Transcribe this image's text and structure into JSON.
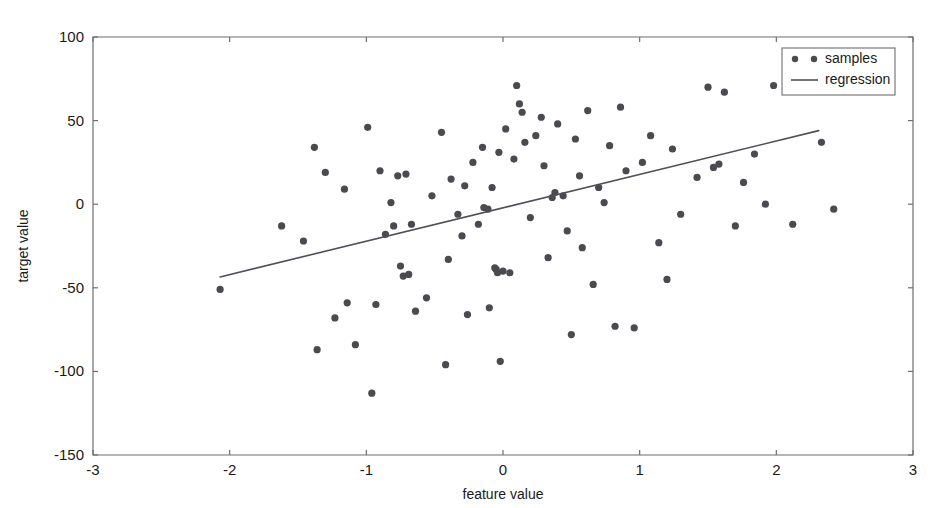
{
  "chart_data": {
    "type": "scatter",
    "title": "",
    "xlabel": "feature value",
    "ylabel": "target value",
    "xlim": [
      -3,
      3
    ],
    "ylim": [
      -150,
      100
    ],
    "xticks": [
      -3,
      -2,
      -1,
      0,
      1,
      2,
      3
    ],
    "xtick_labels": [
      "-3",
      "-2",
      "-1",
      "0",
      "1",
      "2",
      "3"
    ],
    "yticks": [
      -150,
      -100,
      -50,
      0,
      50,
      100
    ],
    "ytick_labels": [
      "-150",
      "-100",
      "-50",
      "0",
      "50",
      "100"
    ],
    "grid": false,
    "legend_position": "upper right",
    "series": [
      {
        "name": "samples",
        "type": "scatter",
        "marker": "circle",
        "color": "#4a4a50",
        "points": [
          [
            -2.07,
            -51
          ],
          [
            -1.62,
            -13
          ],
          [
            -1.46,
            -22
          ],
          [
            -1.38,
            34
          ],
          [
            -1.36,
            -87
          ],
          [
            -1.3,
            19
          ],
          [
            -1.23,
            -68
          ],
          [
            -1.16,
            9
          ],
          [
            -1.14,
            -59
          ],
          [
            -1.08,
            -84
          ],
          [
            -0.99,
            46
          ],
          [
            -0.96,
            -113
          ],
          [
            -0.93,
            -60
          ],
          [
            -0.9,
            20
          ],
          [
            -0.86,
            -18
          ],
          [
            -0.82,
            1
          ],
          [
            -0.8,
            -13
          ],
          [
            -0.77,
            17
          ],
          [
            -0.75,
            -37
          ],
          [
            -0.73,
            -43
          ],
          [
            -0.71,
            18
          ],
          [
            -0.69,
            -42
          ],
          [
            -0.67,
            -12
          ],
          [
            -0.64,
            -64
          ],
          [
            -0.56,
            -56
          ],
          [
            -0.52,
            5
          ],
          [
            -0.45,
            43
          ],
          [
            -0.42,
            -96
          ],
          [
            -0.4,
            -33
          ],
          [
            -0.38,
            15
          ],
          [
            -0.33,
            -6
          ],
          [
            -0.3,
            -19
          ],
          [
            -0.28,
            11
          ],
          [
            -0.26,
            -66
          ],
          [
            -0.22,
            25
          ],
          [
            -0.18,
            -12
          ],
          [
            -0.15,
            34
          ],
          [
            -0.14,
            -2
          ],
          [
            -0.11,
            -3
          ],
          [
            -0.1,
            -62
          ],
          [
            -0.08,
            10
          ],
          [
            -0.06,
            -38
          ],
          [
            -0.05,
            -39
          ],
          [
            -0.04,
            -41
          ],
          [
            -0.03,
            31
          ],
          [
            -0.02,
            -94
          ],
          [
            0.0,
            -40
          ],
          [
            0.02,
            45
          ],
          [
            0.05,
            -41
          ],
          [
            0.08,
            27
          ],
          [
            0.1,
            71
          ],
          [
            0.12,
            60
          ],
          [
            0.14,
            55
          ],
          [
            0.16,
            37
          ],
          [
            0.2,
            -8
          ],
          [
            0.24,
            41
          ],
          [
            0.28,
            52
          ],
          [
            0.3,
            23
          ],
          [
            0.33,
            -32
          ],
          [
            0.36,
            4
          ],
          [
            0.38,
            7
          ],
          [
            0.4,
            48
          ],
          [
            0.44,
            5
          ],
          [
            0.47,
            -16
          ],
          [
            0.5,
            -78
          ],
          [
            0.53,
            39
          ],
          [
            0.56,
            17
          ],
          [
            0.58,
            -26
          ],
          [
            0.62,
            56
          ],
          [
            0.66,
            -48
          ],
          [
            0.7,
            10
          ],
          [
            0.74,
            1
          ],
          [
            0.78,
            35
          ],
          [
            0.82,
            -73
          ],
          [
            0.86,
            58
          ],
          [
            0.9,
            20
          ],
          [
            0.96,
            -74
          ],
          [
            1.02,
            25
          ],
          [
            1.08,
            41
          ],
          [
            1.14,
            -23
          ],
          [
            1.2,
            -45
          ],
          [
            1.24,
            33
          ],
          [
            1.3,
            -6
          ],
          [
            1.42,
            16
          ],
          [
            1.5,
            70
          ],
          [
            1.54,
            22
          ],
          [
            1.58,
            24
          ],
          [
            1.62,
            67
          ],
          [
            1.7,
            -13
          ],
          [
            1.76,
            13
          ],
          [
            1.84,
            30
          ],
          [
            1.92,
            0
          ],
          [
            1.98,
            71
          ],
          [
            2.12,
            -12
          ],
          [
            2.33,
            37
          ],
          [
            2.42,
            -3
          ]
        ]
      },
      {
        "name": "regression",
        "type": "line",
        "color": "#50505a",
        "x_range": [
          -2.07,
          2.31
        ],
        "y_range": [
          -43.5,
          44.0
        ],
        "slope": 20.0,
        "intercept": -2.1
      }
    ],
    "legend_entries": [
      {
        "label": "samples",
        "marker": "dots"
      },
      {
        "label": "regression",
        "marker": "line"
      }
    ]
  }
}
